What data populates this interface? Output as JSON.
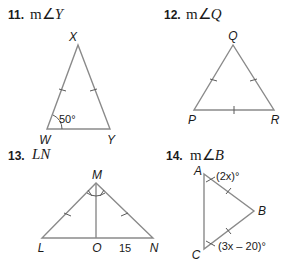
{
  "problems": [
    {
      "number": "11.",
      "prefix": "m∠",
      "target": "Y",
      "vertices": {
        "top": "X",
        "left": "W",
        "right": "Y"
      },
      "given_angle": "50°",
      "congruent_sides": [
        "WX",
        "XY"
      ]
    },
    {
      "number": "12.",
      "prefix": "m∠",
      "target": "Q",
      "vertices": {
        "top": "Q",
        "left": "P",
        "right": "R"
      },
      "congruent_sides": [
        "PQ",
        "QR",
        "PR"
      ]
    },
    {
      "number": "13.",
      "prefix": "",
      "target": "LN",
      "vertices": {
        "top": "M",
        "left": "L",
        "foot": "O",
        "right": "N"
      },
      "segment_label": "15",
      "congruent_sides": [
        "ML",
        "MN"
      ],
      "congruent_angles": [
        "LMO",
        "OMN"
      ]
    },
    {
      "number": "14.",
      "prefix": "m∠",
      "target": "B",
      "vertices": {
        "top": "A",
        "right": "B",
        "bottom": "C"
      },
      "angle_A": "(2x)°",
      "angle_C": "(3x – 20)°",
      "congruent_sides": [
        "AB",
        "BC"
      ]
    }
  ]
}
